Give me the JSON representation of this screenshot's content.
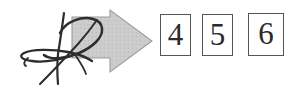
{
  "document": {
    "kind": "scanned-form-fragment",
    "background_color": "#ffffff"
  },
  "annotation": {
    "ink_mark": {
      "icon": "handwritten-signature-scribble",
      "color": "#2d2d2d",
      "description": "looping handwritten ink scribble overlapping the arrow"
    }
  },
  "arrow": {
    "icon": "block-arrow-right-icon",
    "direction": "right",
    "fill_color": "#c9c9c9",
    "stroke_color": "#9a9a9a",
    "label": ""
  },
  "boxes": {
    "border_color": "#555555",
    "text_color": "#2b2b2b",
    "items": [
      {
        "value": "4",
        "name": "box-4"
      },
      {
        "value": "5",
        "name": "box-5"
      },
      {
        "value": "6",
        "name": "box-6"
      }
    ]
  }
}
